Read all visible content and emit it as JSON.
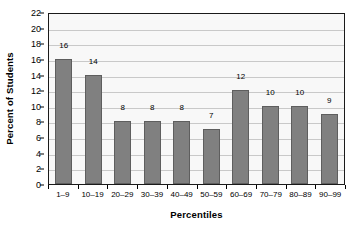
{
  "chart_data": {
    "type": "bar",
    "title": "",
    "subtitle": "",
    "xlabel": "Percentiles",
    "ylabel": "Percent of Students",
    "categories": [
      "1–9",
      "10–19",
      "20–29",
      "30–39",
      "40–49",
      "50–59",
      "60–69",
      "70–79",
      "80–89",
      "90–99"
    ],
    "values": [
      16,
      14,
      8,
      8,
      8,
      7,
      12,
      10,
      10,
      9
    ],
    "data_labels": [
      "16",
      "14",
      "8",
      "8",
      "8",
      "7",
      "12",
      "10",
      "10",
      "9"
    ],
    "ylim": [
      0,
      22
    ],
    "ytick_step": 2,
    "ytick_labels": [
      "0",
      "2",
      "4",
      "6",
      "8",
      "10",
      "12",
      "14",
      "16",
      "18",
      "20",
      "22"
    ],
    "grid": "horizontal",
    "legend": "none",
    "colors": {
      "bar_fill": "#808080",
      "bar_border": "#5e5e5e",
      "plot_background": "#f8f8f8",
      "plot_border": "#1a1a1a",
      "gridline": "#c9c9c9",
      "text": "#000000",
      "page_background": "#ffffff"
    }
  }
}
